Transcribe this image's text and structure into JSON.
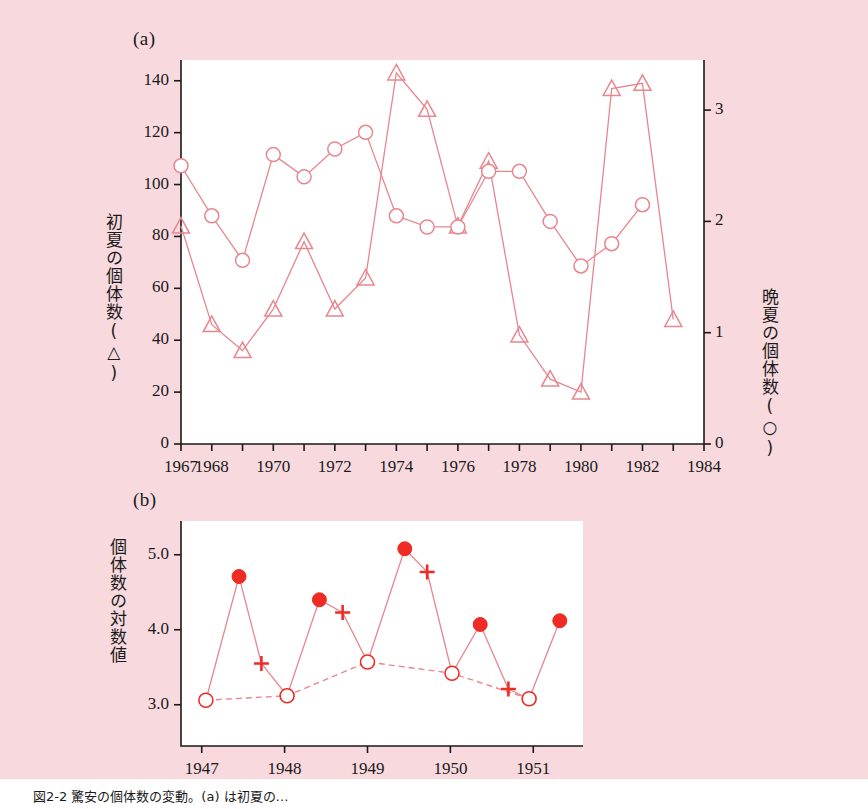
{
  "figure": {
    "panel_a_letter": "(a)",
    "panel_b_letter": "(b)",
    "caption": "図2-2 驚安の個体数の変動。(a) は初夏の…",
    "colors": {
      "background": "#f7d9de",
      "plot_area": "#ffffff",
      "line_pale_red": "#e8868f",
      "marker_bright_red": "#ee2b24",
      "axis_black": "#1a1a1a"
    },
    "axis_titles": {
      "left_a": "初夏の個体数(△)",
      "right_a": "晩夏の個体数(○)",
      "left_b": "個体数の対数値"
    }
  },
  "chart_data": [
    {
      "type": "line",
      "panel": "(a)",
      "title": "",
      "xlabel": "",
      "ylabel": "初夏の個体数(△)",
      "y2label": "晩夏の個体数(○)",
      "xlim": [
        1967,
        1984
      ],
      "ylim": [
        0,
        148
      ],
      "y2lim": [
        0,
        3.45
      ],
      "xticks": [
        1967,
        1968,
        1969,
        1970,
        1971,
        1972,
        1973,
        1974,
        1975,
        1976,
        1977,
        1978,
        1979,
        1980,
        1981,
        1982,
        1983,
        1984
      ],
      "xticklabels": [
        "1967",
        "1968",
        "",
        "1970",
        "",
        "1972",
        "",
        "1974",
        "",
        "1976",
        "",
        "1978",
        "",
        "1980",
        "",
        "1982",
        "",
        "1984"
      ],
      "yticks": [
        0,
        20,
        40,
        60,
        80,
        100,
        120,
        140
      ],
      "yticklabels": [
        "0",
        "20",
        "40",
        "60",
        "80",
        "100",
        "120",
        "140"
      ],
      "y2ticks": [
        0,
        1,
        2,
        3
      ],
      "y2ticklabels": [
        "0",
        "1",
        "2",
        "3"
      ],
      "grid": false,
      "legend": "none",
      "series": [
        {
          "name": "初夏の個体数",
          "marker": "open-triangle",
          "axis": "left",
          "x": [
            1967,
            1968,
            1969,
            1970,
            1971,
            1972,
            1973,
            1974,
            1975,
            1976,
            1977,
            1978,
            1979,
            1980,
            1981,
            1982,
            1983
          ],
          "values": [
            84,
            46,
            36,
            52,
            78,
            52,
            64,
            143,
            129,
            84,
            109,
            42,
            25,
            20,
            137,
            139,
            48
          ]
        },
        {
          "name": "晩夏の個体数",
          "marker": "open-circle",
          "axis": "right",
          "x": [
            1967,
            1968,
            1969,
            1970,
            1971,
            1972,
            1973,
            1974,
            1975,
            1976,
            1977,
            1978,
            1979,
            1980,
            1981,
            1982
          ],
          "values": [
            2.5,
            2.05,
            1.65,
            2.6,
            2.4,
            2.65,
            2.8,
            2.05,
            1.95,
            1.95,
            2.45,
            2.45,
            2.0,
            1.6,
            1.8,
            2.15
          ]
        }
      ]
    },
    {
      "type": "line",
      "panel": "(b)",
      "title": "",
      "xlabel": "",
      "ylabel": "個体数の対数値",
      "xlim": [
        1946.75,
        1951.6
      ],
      "ylim": [
        2.45,
        5.45
      ],
      "xticks": [
        1947,
        1948,
        1949,
        1950,
        1951
      ],
      "xticklabels": [
        "1947",
        "1948",
        "1949",
        "1950",
        "1951"
      ],
      "yticks": [
        3.0,
        4.0,
        5.0
      ],
      "yticklabels": [
        "3.0",
        "4.0",
        "5.0"
      ],
      "grid": false,
      "legend": "none",
      "series": [
        {
          "name": "実測個体数(●=ピーク, +=中間, ○=谷)",
          "marker": "mixed",
          "linestyle": "solid",
          "points": [
            {
              "x": 1947.05,
              "y": 3.06,
              "marker": "open-circle"
            },
            {
              "x": 1947.45,
              "y": 4.71,
              "marker": "filled-circle"
            },
            {
              "x": 1947.72,
              "y": 3.55,
              "marker": "plus"
            },
            {
              "x": 1948.03,
              "y": 3.12,
              "marker": "open-circle"
            },
            {
              "x": 1948.42,
              "y": 4.4,
              "marker": "filled-circle"
            },
            {
              "x": 1948.7,
              "y": 4.23,
              "marker": "plus"
            },
            {
              "x": 1949.0,
              "y": 3.57,
              "marker": "open-circle"
            },
            {
              "x": 1949.45,
              "y": 5.08,
              "marker": "filled-circle"
            },
            {
              "x": 1949.72,
              "y": 4.77,
              "marker": "plus"
            },
            {
              "x": 1950.02,
              "y": 3.42,
              "marker": "open-circle"
            },
            {
              "x": 1950.36,
              "y": 4.07,
              "marker": "filled-circle"
            },
            {
              "x": 1950.7,
              "y": 3.21,
              "marker": "plus"
            },
            {
              "x": 1950.95,
              "y": 3.08,
              "marker": "open-circle"
            },
            {
              "x": 1951.32,
              "y": 4.12,
              "marker": "filled-circle"
            }
          ]
        },
        {
          "name": "谷の推移(破線)",
          "marker": "open-circle",
          "linestyle": "dashed",
          "x": [
            1947.05,
            1948.03,
            1949.0,
            1950.02,
            1950.95
          ],
          "values": [
            3.06,
            3.12,
            3.57,
            3.42,
            3.08
          ]
        }
      ]
    }
  ]
}
